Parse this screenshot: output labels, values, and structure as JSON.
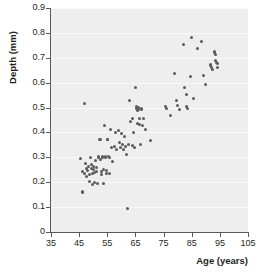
{
  "chart_data": {
    "type": "scatter",
    "title": "",
    "xlabel": "Age (years)",
    "ylabel": "Depth (mm)",
    "xlim": [
      35,
      105
    ],
    "ylim": [
      0,
      0.9
    ],
    "xticks": [
      35,
      45,
      55,
      65,
      75,
      85,
      95,
      105
    ],
    "yticks": [
      0,
      0.1,
      0.2,
      0.3,
      0.4,
      0.5,
      0.6,
      0.7,
      0.8,
      0.9
    ],
    "xtick_labels": [
      "35",
      "45",
      "55",
      "65",
      "75",
      "85",
      "95",
      "105"
    ],
    "ytick_labels": [
      "0",
      "0.1",
      "0.2",
      "0.3",
      "0.4",
      "0.5",
      "0.6",
      "0.7",
      "0.8",
      "0.9"
    ],
    "grid": "horizontal",
    "legend": "none",
    "marker_color": "#5b5b5b",
    "panel_color": "#eeeeee",
    "gridline_color": "#f9f9f9",
    "axis_color": "#58595b",
    "points": [
      [
        45.5,
        0.295
      ],
      [
        46.0,
        0.245
      ],
      [
        46.2,
        0.163
      ],
      [
        46.3,
        0.157
      ],
      [
        46.8,
        0.235
      ],
      [
        47.0,
        0.515
      ],
      [
        47.2,
        0.275
      ],
      [
        47.5,
        0.255
      ],
      [
        47.6,
        0.225
      ],
      [
        48.0,
        0.248
      ],
      [
        48.3,
        0.262
      ],
      [
        48.5,
        0.232
      ],
      [
        48.8,
        0.205
      ],
      [
        49.0,
        0.3
      ],
      [
        49.2,
        0.255
      ],
      [
        49.4,
        0.272
      ],
      [
        49.6,
        0.235
      ],
      [
        49.8,
        0.193
      ],
      [
        50.0,
        0.262
      ],
      [
        50.2,
        0.25
      ],
      [
        50.4,
        0.238
      ],
      [
        50.6,
        0.2
      ],
      [
        50.8,
        0.288
      ],
      [
        51.0,
        0.243
      ],
      [
        51.2,
        0.258
      ],
      [
        51.5,
        0.196
      ],
      [
        51.8,
        0.302
      ],
      [
        52.0,
        0.3
      ],
      [
        52.2,
        0.372
      ],
      [
        52.4,
        0.37
      ],
      [
        52.6,
        0.292
      ],
      [
        52.8,
        0.243
      ],
      [
        53.0,
        0.233
      ],
      [
        53.2,
        0.305
      ],
      [
        53.4,
        0.298
      ],
      [
        53.6,
        0.253
      ],
      [
        53.8,
        0.196
      ],
      [
        54.0,
        0.427
      ],
      [
        54.2,
        0.303
      ],
      [
        54.4,
        0.3
      ],
      [
        54.6,
        0.246
      ],
      [
        54.8,
        0.236
      ],
      [
        55.0,
        0.372
      ],
      [
        55.2,
        0.37
      ],
      [
        55.4,
        0.303
      ],
      [
        55.6,
        0.298
      ],
      [
        55.8,
        0.235
      ],
      [
        56.2,
        0.413
      ],
      [
        56.5,
        0.338
      ],
      [
        57.0,
        0.282
      ],
      [
        57.5,
        0.345
      ],
      [
        58.0,
        0.398
      ],
      [
        58.4,
        0.333
      ],
      [
        59.0,
        0.41
      ],
      [
        59.3,
        0.358
      ],
      [
        59.6,
        0.34
      ],
      [
        60.0,
        0.395
      ],
      [
        60.3,
        0.35
      ],
      [
        60.6,
        0.332
      ],
      [
        61.0,
        0.385
      ],
      [
        61.4,
        0.345
      ],
      [
        61.8,
        0.31
      ],
      [
        62.0,
        0.095
      ],
      [
        62.5,
        0.352
      ],
      [
        63.0,
        0.527
      ],
      [
        63.4,
        0.443
      ],
      [
        63.8,
        0.348
      ],
      [
        64.0,
        0.455
      ],
      [
        64.4,
        0.398
      ],
      [
        64.8,
        0.338
      ],
      [
        65.0,
        0.582
      ],
      [
        65.2,
        0.503
      ],
      [
        65.4,
        0.498
      ],
      [
        65.6,
        0.49
      ],
      [
        65.8,
        0.435
      ],
      [
        66.0,
        0.5
      ],
      [
        66.2,
        0.494
      ],
      [
        66.4,
        0.455
      ],
      [
        66.6,
        0.432
      ],
      [
        66.8,
        0.35
      ],
      [
        67.0,
        0.498
      ],
      [
        67.3,
        0.492
      ],
      [
        67.6,
        0.428
      ],
      [
        68.0,
        0.455
      ],
      [
        68.5,
        0.412
      ],
      [
        70.5,
        0.366
      ],
      [
        75.5,
        0.505
      ],
      [
        76.0,
        0.498
      ],
      [
        77.5,
        0.47
      ],
      [
        79.0,
        0.637
      ],
      [
        79.5,
        0.53
      ],
      [
        80.0,
        0.508
      ],
      [
        80.5,
        0.492
      ],
      [
        82.0,
        0.755
      ],
      [
        82.5,
        0.58
      ],
      [
        83.0,
        0.553
      ],
      [
        83.2,
        0.503
      ],
      [
        83.4,
        0.495
      ],
      [
        84.5,
        0.626
      ],
      [
        85.0,
        0.781
      ],
      [
        85.5,
        0.535
      ],
      [
        87.0,
        0.738
      ],
      [
        88.5,
        0.766
      ],
      [
        89.0,
        0.628
      ],
      [
        90.0,
        0.594
      ],
      [
        91.5,
        0.675
      ],
      [
        91.8,
        0.668
      ],
      [
        92.0,
        0.662
      ],
      [
        92.2,
        0.655
      ],
      [
        93.0,
        0.727
      ],
      [
        93.2,
        0.72
      ],
      [
        93.4,
        0.712
      ],
      [
        93.6,
        0.69
      ],
      [
        93.8,
        0.683
      ],
      [
        94.0,
        0.676
      ],
      [
        94.2,
        0.66
      ]
    ]
  }
}
